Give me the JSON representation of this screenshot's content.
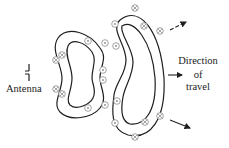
{
  "diagram": {
    "labels": {
      "antenna": "Antenna",
      "direction_line1": "Direction",
      "direction_line2": "of",
      "direction_line3": "travel"
    },
    "symbols": {
      "out_of_page": "⊙",
      "into_page": "⊗"
    },
    "colors": {
      "line": "#1f1f1f",
      "symbol": "#8a8a8a",
      "background": "#ffffff"
    }
  }
}
